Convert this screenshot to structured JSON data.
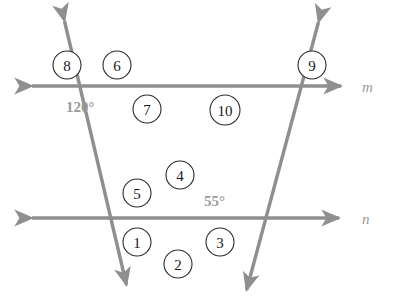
{
  "figure": {
    "background_color": "#ffffff",
    "line_color": "#8f8f8f",
    "label_color": "#9a9a9a",
    "circle_stroke_color": "#2b2b2b",
    "circle_fill_color": "#ffffff",
    "number_color": "#1a1a1a"
  },
  "lines": [
    {
      "id": "line-m",
      "label": "m",
      "label_x": 362,
      "label_y": 92,
      "x1": 26,
      "y1": 86,
      "x2": 347,
      "y2": 86,
      "arrows": "both"
    },
    {
      "id": "line-n",
      "label": "n",
      "label_x": 362,
      "label_y": 224,
      "x1": 26,
      "y1": 218,
      "x2": 345,
      "y2": 218,
      "arrows": "both"
    },
    {
      "id": "transversal-left",
      "label": "",
      "x1": 63,
      "y1": 15,
      "x2": 128,
      "y2": 292,
      "arrows": "both"
    },
    {
      "id": "transversal-right",
      "label": "",
      "x1": 320,
      "y1": 16,
      "x2": 245,
      "y2": 297,
      "arrows": "both"
    }
  ],
  "intersections": [
    {
      "id": "m-left",
      "x": 104,
      "y": 86
    },
    {
      "id": "m-right",
      "x": 270,
      "y": 86
    },
    {
      "id": "n-vertex",
      "x": 178,
      "y": 218
    }
  ],
  "angle_labels": [
    {
      "id": "angle-120",
      "text": "120°",
      "x": 66,
      "y": 112
    },
    {
      "id": "angle-55",
      "text": "55°",
      "x": 204,
      "y": 206
    }
  ],
  "numbered_angles": [
    {
      "id": "angle-1",
      "number": "1",
      "cx": 137,
      "cy": 242,
      "r": 14
    },
    {
      "id": "angle-2",
      "number": "2",
      "cx": 178,
      "cy": 264,
      "r": 14
    },
    {
      "id": "angle-3",
      "number": "3",
      "cx": 220,
      "cy": 242,
      "r": 14
    },
    {
      "id": "angle-4",
      "number": "4",
      "cx": 180,
      "cy": 175,
      "r": 14
    },
    {
      "id": "angle-5",
      "number": "5",
      "cx": 137,
      "cy": 193,
      "r": 14
    },
    {
      "id": "angle-6",
      "number": "6",
      "cx": 117,
      "cy": 65,
      "r": 14
    },
    {
      "id": "angle-7",
      "number": "7",
      "cx": 147,
      "cy": 109,
      "r": 14
    },
    {
      "id": "angle-8",
      "number": "8",
      "cx": 67,
      "cy": 65,
      "r": 14
    },
    {
      "id": "angle-9",
      "number": "9",
      "cx": 312,
      "cy": 65,
      "r": 14
    },
    {
      "id": "angle-10",
      "number": "10",
      "cx": 225,
      "cy": 110,
      "r": 15
    }
  ]
}
